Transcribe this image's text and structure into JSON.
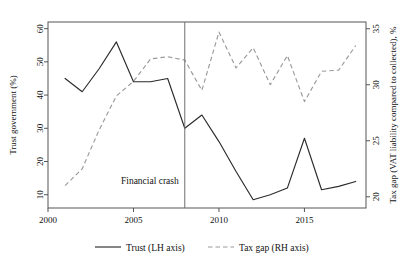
{
  "chart_data": {
    "type": "line",
    "title": "",
    "subtitle": "",
    "xlabel": "",
    "ylabel": "Trust government (%)",
    "y2label": "Tax gap (VAT liability compared to collected), %",
    "grid": false,
    "legend_position": "bottom",
    "xlim": [
      2000,
      2018.6
    ],
    "ylim": [
      6,
      62
    ],
    "y2lim": [
      19,
      35.6
    ],
    "xticks": [
      2000,
      2005,
      2010,
      2015
    ],
    "xticklabels": [
      "2000",
      "2005",
      "2010",
      "2015"
    ],
    "yticks": [
      10,
      20,
      30,
      40,
      50,
      60
    ],
    "yticklabels": [
      "10",
      "20",
      "30",
      "40",
      "50",
      "60"
    ],
    "y2ticks": [
      20,
      25,
      30,
      35
    ],
    "y2ticklabels": [
      "20",
      "25",
      "30",
      "35"
    ],
    "annotations": [
      {
        "name": "financial-crash",
        "label": "Financial crash",
        "x": 2008,
        "type": "vline"
      }
    ],
    "series": [
      {
        "name": "Trust (LH axis)",
        "axis": "left",
        "style": "solid",
        "color": "#2b2b2b",
        "x": [
          2001,
          2002,
          2003,
          2004,
          2005,
          2006,
          2007,
          2008,
          2009,
          2010,
          2011,
          2012,
          2013,
          2014,
          2015,
          2016,
          2017,
          2018
        ],
        "values": [
          45,
          41,
          48,
          56,
          44,
          44,
          45,
          30,
          34,
          26,
          17,
          8.5,
          10,
          12,
          27,
          11.5,
          12.5,
          14
        ]
      },
      {
        "name": "Tax gap (RH axis)",
        "axis": "right",
        "style": "dashed",
        "color": "#9a9a9a",
        "x": [
          2001,
          2002,
          2003,
          2004,
          2005,
          2006,
          2007,
          2008,
          2009,
          2010,
          2011,
          2012,
          2013,
          2014,
          2015,
          2016,
          2017,
          2018
        ],
        "values": [
          21,
          22.5,
          26,
          29,
          30.3,
          32.3,
          32.5,
          32.2,
          29.5,
          34.7,
          31.5,
          33.3,
          30,
          32.6,
          28.5,
          31.2,
          31.3,
          33.5
        ]
      }
    ],
    "legend": [
      {
        "name": "Trust (LH axis)",
        "style": "solid",
        "color": "#2b2b2b"
      },
      {
        "name": "Tax gap (RH axis)",
        "style": "dashed",
        "color": "#9a9a9a"
      }
    ]
  }
}
